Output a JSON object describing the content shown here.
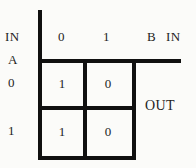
{
  "figure": {
    "type": "truth-table",
    "ink_color": "#101010",
    "text_color": "#232323",
    "background_color": "#fbfbf9"
  },
  "labels": {
    "in_left": "IN",
    "in_right": "IN",
    "input_b": "B",
    "input_a": "A",
    "output": "OUT"
  },
  "column_headers": [
    "0",
    "1"
  ],
  "row_headers": [
    "0",
    "1"
  ],
  "chart_data": {
    "type": "table",
    "title": "",
    "xlabel": "B IN",
    "ylabel": "A IN",
    "categories": [
      "0",
      "1"
    ],
    "row_categories": [
      "0",
      "1"
    ],
    "cells": [
      [
        "1",
        "0"
      ],
      [
        "1",
        "0"
      ]
    ],
    "output_label": "OUT"
  }
}
